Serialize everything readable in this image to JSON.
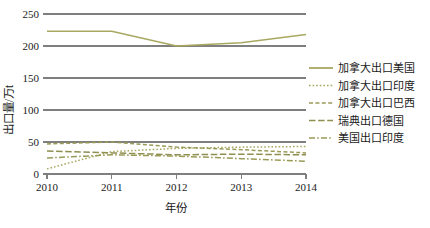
{
  "chart_data": {
    "type": "line",
    "title": "",
    "xlabel": "年份",
    "ylabel": "出口量/万t",
    "x": [
      2010,
      2011,
      2012,
      2013,
      2014
    ],
    "xtick_labels": [
      "2010",
      "2011",
      "2012",
      "2013",
      "2014"
    ],
    "ytick_labels": [
      "0",
      "50",
      "100",
      "150",
      "200",
      "250"
    ],
    "yticks": [
      0,
      50,
      100,
      150,
      200,
      250
    ],
    "ylim": [
      0,
      250
    ],
    "grid": "horizontal",
    "legend_position": "right",
    "series": [
      {
        "name": "加拿大出口美国",
        "style": "solid",
        "color": "#a8a860",
        "values": [
          223,
          223,
          200,
          205,
          218
        ]
      },
      {
        "name": "加拿大出口印度",
        "style": "dotted",
        "color": "#a8a860",
        "values": [
          8,
          35,
          40,
          42,
          43
        ]
      },
      {
        "name": "加拿大出口巴西",
        "style": "dashed",
        "color": "#9a9a58",
        "values": [
          47,
          50,
          42,
          38,
          33
        ]
      },
      {
        "name": "瑞典出口德国",
        "style": "long-dash",
        "color": "#8f8f50",
        "values": [
          36,
          33,
          30,
          31,
          30
        ]
      },
      {
        "name": "美国出口印度",
        "style": "dash-dot",
        "color": "#9a9a58",
        "values": [
          25,
          30,
          28,
          24,
          20
        ]
      }
    ]
  },
  "legend": {
    "items": [
      {
        "label": "加拿大出口美国"
      },
      {
        "label": "加拿大出口印度"
      },
      {
        "label": "加拿大出口巴西"
      },
      {
        "label": "瑞典出口德国"
      },
      {
        "label": "美国出口印度"
      }
    ]
  }
}
